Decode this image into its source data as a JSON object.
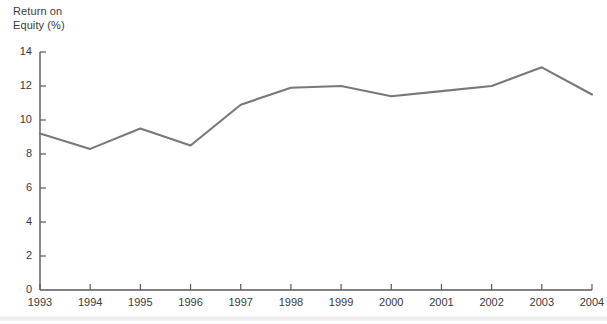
{
  "chart_data": {
    "type": "line",
    "title": "Return on\nEquity (%)",
    "title_lines": [
      "Return on",
      "Equity (%)"
    ],
    "xlabel": "",
    "ylabel": "Return on Equity (%)",
    "categories": [
      "1993",
      "1994",
      "1995",
      "1996",
      "1997",
      "1998",
      "1999",
      "2000",
      "2001",
      "2002",
      "2003",
      "2004"
    ],
    "values": [
      9.2,
      8.3,
      9.5,
      8.5,
      10.9,
      11.9,
      12.0,
      11.4,
      11.7,
      12.0,
      13.1,
      11.5
    ],
    "series": [
      {
        "name": "Return on Equity (%)",
        "values": [
          9.2,
          8.3,
          9.5,
          8.5,
          10.9,
          11.9,
          12.0,
          11.4,
          11.7,
          12.0,
          13.1,
          11.5
        ],
        "color": "#77787b"
      }
    ],
    "ylim": [
      0,
      14
    ],
    "yticks": [
      0,
      2,
      4,
      6,
      8,
      10,
      12,
      14
    ],
    "ytick_labels": [
      "0",
      "2",
      "4",
      "6",
      "8",
      "10",
      "12",
      "14"
    ],
    "xtick_labels": [
      "1993",
      "1994",
      "1995",
      "1996",
      "1997",
      "1998",
      "1999",
      "2000",
      "2001",
      "2002",
      "2003",
      "2004"
    ],
    "grid": false,
    "legend": "none",
    "line_color": "#77787b",
    "axis_color": "#58595b",
    "text_color": "#3a3a3a",
    "background": "#ffffff"
  }
}
